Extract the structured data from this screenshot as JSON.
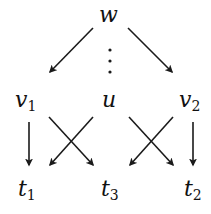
{
  "diagram": {
    "type": "directed-graph",
    "nodes": [
      {
        "id": "w",
        "base": "w",
        "sub": "",
        "x": 110,
        "y": 22
      },
      {
        "id": "v1",
        "base": "v",
        "sub": "1",
        "x": 22,
        "y": 107
      },
      {
        "id": "u",
        "base": "u",
        "sub": "",
        "x": 110,
        "y": 107
      },
      {
        "id": "v2",
        "base": "v",
        "sub": "2",
        "x": 186,
        "y": 107
      },
      {
        "id": "t1",
        "base": "t",
        "sub": "1",
        "x": 22,
        "y": 197
      },
      {
        "id": "t3",
        "base": "t",
        "sub": "3",
        "x": 104,
        "y": 197
      },
      {
        "id": "t2",
        "base": "t",
        "sub": "2",
        "x": 186,
        "y": 197
      }
    ],
    "edges": [
      {
        "from": "w",
        "to": "v1"
      },
      {
        "from": "w",
        "to": "v2"
      },
      {
        "from": "v1",
        "to": "t1"
      },
      {
        "from": "v1",
        "to": "t3"
      },
      {
        "from": "u",
        "to": "t1"
      },
      {
        "from": "u",
        "to": "t2"
      },
      {
        "from": "v2",
        "to": "t3"
      },
      {
        "from": "v2",
        "to": "t2"
      }
    ],
    "ellipsis": {
      "between": [
        "w",
        "u"
      ],
      "symbol": "⋮"
    },
    "stroke_color": "#1a1a1a",
    "label_color": "#111111"
  }
}
